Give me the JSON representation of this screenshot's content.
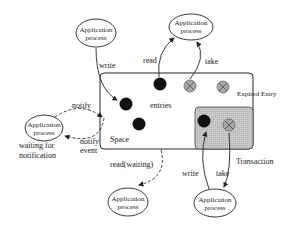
{
  "diagram": {
    "type": "tuple-space-architecture",
    "space": {
      "label": "Space",
      "entries_label": "entries"
    },
    "transaction": {
      "label": "Transaction"
    },
    "expired_entry_label": "Expired Entry",
    "processes": [
      {
        "id": "p_top_left",
        "line1": "Application",
        "line2": "process"
      },
      {
        "id": "p_top_right",
        "line1": "Application",
        "line2": "process"
      },
      {
        "id": "p_left",
        "line1": "Application",
        "line2": "process"
      },
      {
        "id": "p_bottom",
        "line1": "Application",
        "line2": "process"
      },
      {
        "id": "p_bottom_right",
        "line1": "Application",
        "line2": "process"
      }
    ],
    "edges": {
      "write": "write",
      "read": "read",
      "take": "take",
      "notify": "notify",
      "notify_event_1": "notify",
      "notify_event_2": "event",
      "read_waiting": "read(waiting)",
      "tx_write": "write",
      "tx_take": "take"
    },
    "waiting": {
      "line1": "waiting for",
      "line2": "notification"
    },
    "colors": {
      "line": "#222222",
      "entry": "#111111",
      "expired": "#9a9a9a",
      "transaction_fill": "#c8c8c8"
    }
  }
}
